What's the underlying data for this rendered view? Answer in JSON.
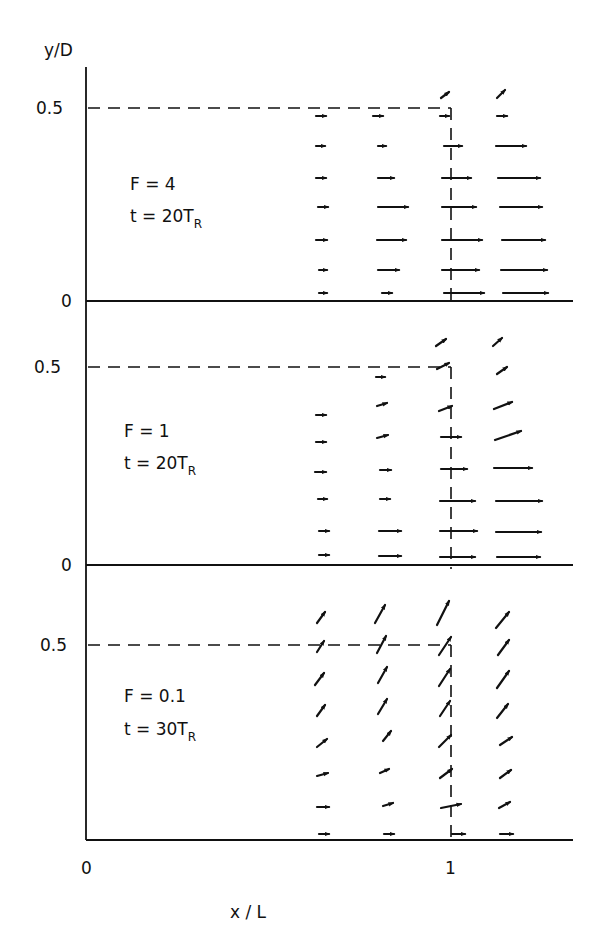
{
  "chart_data": {
    "type": "vector-field",
    "title": "",
    "xlabel": "x / L",
    "ylabel": "y/D",
    "x_ticks": [
      "0",
      "1"
    ],
    "y_ticks": [
      "0",
      "0.5"
    ],
    "xlim": [
      0,
      1.34
    ],
    "grid": false,
    "reference_lines": {
      "y": 0.5,
      "x": 1.0,
      "style": "dashed"
    },
    "panels": [
      {
        "name": "F = 4",
        "label_F": "F = 4",
        "label_t": "t = 20T",
        "label_t_sub": "R",
        "y0_px": 301,
        "yhalf_px": 108,
        "top_px": 67,
        "note": "arrows: x (px), y (px), dx (px), dy (px, negative = up)",
        "arrows": [
          {
            "x": 316,
            "y": 116,
            "dx": 10,
            "dy": 0
          },
          {
            "x": 316,
            "y": 146,
            "dx": 9,
            "dy": 0
          },
          {
            "x": 316,
            "y": 178,
            "dx": 10,
            "dy": 0
          },
          {
            "x": 318,
            "y": 207,
            "dx": 10,
            "dy": 0
          },
          {
            "x": 316,
            "y": 240,
            "dx": 11,
            "dy": 0
          },
          {
            "x": 319,
            "y": 270,
            "dx": 8,
            "dy": 0
          },
          {
            "x": 319,
            "y": 293,
            "dx": 8,
            "dy": 0
          },
          {
            "x": 373,
            "y": 116,
            "dx": 10,
            "dy": 0
          },
          {
            "x": 378,
            "y": 146,
            "dx": 8,
            "dy": 0
          },
          {
            "x": 378,
            "y": 178,
            "dx": 16,
            "dy": 0
          },
          {
            "x": 378,
            "y": 207,
            "dx": 30,
            "dy": 0
          },
          {
            "x": 377,
            "y": 240,
            "dx": 29,
            "dy": 0
          },
          {
            "x": 378,
            "y": 270,
            "dx": 21,
            "dy": 0
          },
          {
            "x": 382,
            "y": 293,
            "dx": 10,
            "dy": 0
          },
          {
            "x": 441,
            "y": 98,
            "dx": 8,
            "dy": -6
          },
          {
            "x": 440,
            "y": 116,
            "dx": 9,
            "dy": 0
          },
          {
            "x": 444,
            "y": 146,
            "dx": 18,
            "dy": 0
          },
          {
            "x": 442,
            "y": 178,
            "dx": 29,
            "dy": 0
          },
          {
            "x": 442,
            "y": 207,
            "dx": 34,
            "dy": 0
          },
          {
            "x": 442,
            "y": 240,
            "dx": 40,
            "dy": 0
          },
          {
            "x": 442,
            "y": 270,
            "dx": 37,
            "dy": 0
          },
          {
            "x": 444,
            "y": 293,
            "dx": 40,
            "dy": 0
          },
          {
            "x": 497,
            "y": 98,
            "dx": 8,
            "dy": -8
          },
          {
            "x": 497,
            "y": 116,
            "dx": 10,
            "dy": 0
          },
          {
            "x": 496,
            "y": 146,
            "dx": 30,
            "dy": 0
          },
          {
            "x": 498,
            "y": 178,
            "dx": 42,
            "dy": 0
          },
          {
            "x": 500,
            "y": 207,
            "dx": 42,
            "dy": 0
          },
          {
            "x": 502,
            "y": 240,
            "dx": 43,
            "dy": 0
          },
          {
            "x": 501,
            "y": 270,
            "dx": 46,
            "dy": 0
          },
          {
            "x": 503,
            "y": 293,
            "dx": 45,
            "dy": 0
          }
        ]
      },
      {
        "name": "F = 1",
        "label_F": "F = 1",
        "label_t": "t = 20T",
        "label_t_sub": "R",
        "y0_px": 565,
        "yhalf_px": 367,
        "top_px": 301,
        "arrows": [
          {
            "x": 316,
            "y": 415,
            "dx": 10,
            "dy": 0
          },
          {
            "x": 316,
            "y": 442,
            "dx": 10,
            "dy": 0
          },
          {
            "x": 315,
            "y": 472,
            "dx": 11,
            "dy": 0
          },
          {
            "x": 318,
            "y": 499,
            "dx": 9,
            "dy": 0
          },
          {
            "x": 319,
            "y": 531,
            "dx": 10,
            "dy": 0
          },
          {
            "x": 319,
            "y": 555,
            "dx": 10,
            "dy": 0
          },
          {
            "x": 376,
            "y": 377,
            "dx": 9,
            "dy": 0
          },
          {
            "x": 377,
            "y": 406,
            "dx": 10,
            "dy": -3
          },
          {
            "x": 377,
            "y": 438,
            "dx": 11,
            "dy": -3
          },
          {
            "x": 380,
            "y": 470,
            "dx": 11,
            "dy": 0
          },
          {
            "x": 380,
            "y": 499,
            "dx": 10,
            "dy": 0
          },
          {
            "x": 379,
            "y": 531,
            "dx": 22,
            "dy": 0
          },
          {
            "x": 379,
            "y": 556,
            "dx": 22,
            "dy": 0
          },
          {
            "x": 436,
            "y": 346,
            "dx": 10,
            "dy": -7
          },
          {
            "x": 437,
            "y": 369,
            "dx": 12,
            "dy": -6
          },
          {
            "x": 439,
            "y": 411,
            "dx": 13,
            "dy": -5
          },
          {
            "x": 441,
            "y": 437,
            "dx": 20,
            "dy": 0
          },
          {
            "x": 441,
            "y": 469,
            "dx": 26,
            "dy": 0
          },
          {
            "x": 440,
            "y": 501,
            "dx": 35,
            "dy": 0
          },
          {
            "x": 440,
            "y": 531,
            "dx": 37,
            "dy": 0
          },
          {
            "x": 440,
            "y": 557,
            "dx": 35,
            "dy": 0
          },
          {
            "x": 493,
            "y": 346,
            "dx": 9,
            "dy": -8
          },
          {
            "x": 497,
            "y": 374,
            "dx": 10,
            "dy": -7
          },
          {
            "x": 494,
            "y": 409,
            "dx": 18,
            "dy": -7
          },
          {
            "x": 495,
            "y": 440,
            "dx": 26,
            "dy": -9
          },
          {
            "x": 494,
            "y": 468,
            "dx": 38,
            "dy": 0
          },
          {
            "x": 496,
            "y": 501,
            "dx": 46,
            "dy": 0
          },
          {
            "x": 496,
            "y": 532,
            "dx": 45,
            "dy": 0
          },
          {
            "x": 497,
            "y": 557,
            "dx": 43,
            "dy": 0
          }
        ]
      },
      {
        "name": "F = 0.1",
        "label_F": "F = 0.1",
        "label_t": "t = 30T",
        "label_t_sub": "R",
        "y0_px": 840,
        "yhalf_px": 645,
        "top_px": 565,
        "arrows": [
          {
            "x": 317,
            "y": 623,
            "dx": 8,
            "dy": -11
          },
          {
            "x": 317,
            "y": 652,
            "dx": 7,
            "dy": -11
          },
          {
            "x": 315,
            "y": 685,
            "dx": 9,
            "dy": -12
          },
          {
            "x": 317,
            "y": 716,
            "dx": 8,
            "dy": -11
          },
          {
            "x": 317,
            "y": 747,
            "dx": 10,
            "dy": -8
          },
          {
            "x": 317,
            "y": 776,
            "dx": 11,
            "dy": -3
          },
          {
            "x": 317,
            "y": 807,
            "dx": 12,
            "dy": 0
          },
          {
            "x": 319,
            "y": 834,
            "dx": 10,
            "dy": 0
          },
          {
            "x": 375,
            "y": 623,
            "dx": 10,
            "dy": -18
          },
          {
            "x": 377,
            "y": 653,
            "dx": 9,
            "dy": -17
          },
          {
            "x": 378,
            "y": 683,
            "dx": 9,
            "dy": -16
          },
          {
            "x": 378,
            "y": 714,
            "dx": 9,
            "dy": -15
          },
          {
            "x": 383,
            "y": 741,
            "dx": 8,
            "dy": -10
          },
          {
            "x": 380,
            "y": 773,
            "dx": 9,
            "dy": -4
          },
          {
            "x": 383,
            "y": 806,
            "dx": 10,
            "dy": -3
          },
          {
            "x": 384,
            "y": 834,
            "dx": 10,
            "dy": 0
          },
          {
            "x": 437,
            "y": 625,
            "dx": 12,
            "dy": -24
          },
          {
            "x": 439,
            "y": 655,
            "dx": 12,
            "dy": -18
          },
          {
            "x": 439,
            "y": 686,
            "dx": 11,
            "dy": -17
          },
          {
            "x": 440,
            "y": 716,
            "dx": 10,
            "dy": -15
          },
          {
            "x": 439,
            "y": 747,
            "dx": 12,
            "dy": -12
          },
          {
            "x": 440,
            "y": 778,
            "dx": 12,
            "dy": -9
          },
          {
            "x": 441,
            "y": 808,
            "dx": 20,
            "dy": -4
          },
          {
            "x": 452,
            "y": 834,
            "dx": 13,
            "dy": 0
          },
          {
            "x": 496,
            "y": 628,
            "dx": 13,
            "dy": -16
          },
          {
            "x": 498,
            "y": 655,
            "dx": 11,
            "dy": -15
          },
          {
            "x": 497,
            "y": 688,
            "dx": 12,
            "dy": -17
          },
          {
            "x": 497,
            "y": 718,
            "dx": 11,
            "dy": -14
          },
          {
            "x": 500,
            "y": 745,
            "dx": 12,
            "dy": -8
          },
          {
            "x": 500,
            "y": 778,
            "dx": 11,
            "dy": -8
          },
          {
            "x": 499,
            "y": 808,
            "dx": 11,
            "dy": -6
          },
          {
            "x": 500,
            "y": 834,
            "dx": 13,
            "dy": 0
          }
        ]
      }
    ]
  },
  "axes": {
    "ylabel": "y/D",
    "xlabel": "x / L",
    "y_tick_half": "0.5",
    "y_tick_zero": "0",
    "x_tick_zero": "0",
    "x_tick_one": "1"
  },
  "colors": {
    "ink": "#111111",
    "background": "#ffffff"
  }
}
